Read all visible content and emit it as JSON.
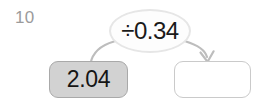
{
  "canvas": {
    "width": 264,
    "height": 103,
    "background": "#ffffff"
  },
  "question": {
    "number_label": "10",
    "number_color": "#9b9b9b"
  },
  "diagram": {
    "type": "function-machine",
    "operator_bubble": {
      "text": "÷0.34",
      "operator_symbol": "÷",
      "operand": "0.34",
      "shape": "ellipse",
      "fill": "#fdfdfd",
      "border_color": "#e6e6e6",
      "text_color": "#1a1a1a"
    },
    "input_box": {
      "value": "2.04",
      "filled": true,
      "fill": "#d2d2d2",
      "border_color": "#a9a9a9",
      "text_color": "#151515"
    },
    "output_box": {
      "value": "",
      "filled": false,
      "placeholder": "",
      "fill": "#ffffff",
      "border_color": "#cacaca",
      "text_color": "#151515"
    },
    "arrows": {
      "stroke_color": "#bdbdbd",
      "inbound": {
        "label": "input-to-operator",
        "has_arrowhead": false
      },
      "outbound": {
        "label": "operator-to-output",
        "has_arrowhead": true,
        "arrowhead_direction": "down"
      }
    }
  }
}
